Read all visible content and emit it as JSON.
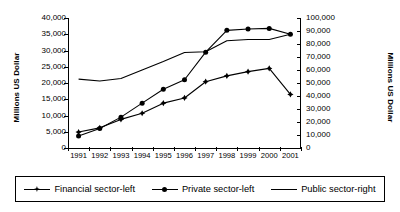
{
  "chart_data": {
    "type": "line",
    "title": "",
    "xlabel": "",
    "ylabel": "Millions US Dollar",
    "y2label": "Millions US Dollar",
    "categories": [
      "1991",
      "1992",
      "1993",
      "1994",
      "1995",
      "1996",
      "1997",
      "1998",
      "1999",
      "2000",
      "2001"
    ],
    "ylim": [
      0,
      40000
    ],
    "y2lim": [
      0,
      100000
    ],
    "yticks": [
      "0",
      "5,000",
      "10,000",
      "15,000",
      "20,000",
      "25,000",
      "30,000",
      "35,000",
      "40,000"
    ],
    "y2ticks": [
      "0",
      "10,000",
      "20,000",
      "30,000",
      "40,000",
      "50,000",
      "60,000",
      "70,000",
      "80,000",
      "90,000",
      "100,000"
    ],
    "grid": false,
    "legend_position": "bottom",
    "series": [
      {
        "name": "Financial sector-left",
        "axis": "left",
        "marker": "cross",
        "values": [
          4900,
          6200,
          8800,
          10700,
          13800,
          15400,
          20400,
          22200,
          23500,
          24500,
          16500
        ]
      },
      {
        "name": "Private sector-left",
        "axis": "left",
        "marker": "round",
        "values": [
          3700,
          6000,
          9500,
          13800,
          18100,
          21000,
          29500,
          36200,
          36600,
          36800,
          35000
        ]
      },
      {
        "name": "Public sector-right",
        "axis": "right",
        "marker": "none",
        "values": [
          53000,
          51500,
          53500,
          60000,
          66500,
          73500,
          74000,
          82500,
          83500,
          83500,
          87500
        ]
      }
    ]
  },
  "axes": {
    "left_title": "Millions US Dollar",
    "right_title": "Millions US Dollar",
    "left_ticks": [
      "40,000",
      "35,000",
      "30,000",
      "25,000",
      "20,000",
      "15,000",
      "10,000",
      "5,000",
      "0"
    ],
    "right_ticks": [
      "100,000",
      "90,000",
      "80,000",
      "70,000",
      "60,000",
      "50,000",
      "40,000",
      "30,000",
      "20,000",
      "10,000",
      "0"
    ],
    "x_ticks": [
      "1991",
      "1992",
      "1993",
      "1994",
      "1995",
      "1996",
      "1997",
      "1998",
      "1999",
      "2000",
      "2001"
    ]
  },
  "legend": {
    "items": [
      {
        "label": "Financial sector-left",
        "marker": "cross"
      },
      {
        "label": "Private sector-left",
        "marker": "round"
      },
      {
        "label": "Public sector-right",
        "marker": "none"
      }
    ]
  }
}
